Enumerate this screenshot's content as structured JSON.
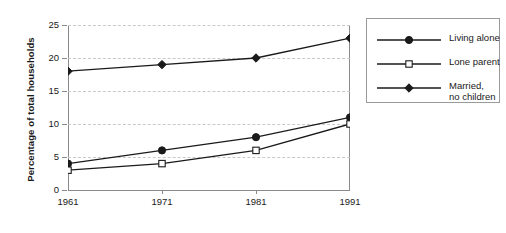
{
  "chart_data": {
    "type": "line",
    "title": "",
    "xlabel": "",
    "ylabel": "Percentage of total households",
    "categories": [
      "1961",
      "1971",
      "1981",
      "1991"
    ],
    "x": [
      1961,
      1971,
      1981,
      1991
    ],
    "xlim": [
      1961,
      1991
    ],
    "ylim": [
      0,
      25
    ],
    "yticks": [
      "0",
      "5",
      "10",
      "15",
      "20",
      "25"
    ],
    "ytick_values": [
      0,
      5,
      10,
      15,
      20,
      25
    ],
    "grid": "horizontal-dashed",
    "legend_position": "right-outside",
    "series": [
      {
        "name": "Living alone",
        "marker": "filled-circle",
        "values": [
          4,
          6,
          8,
          11
        ]
      },
      {
        "name": "Lone parent",
        "marker": "open-square",
        "values": [
          3,
          4,
          6,
          10
        ]
      },
      {
        "name": "Married,\nno children",
        "marker": "filled-diamond",
        "values": [
          18,
          19,
          20,
          23
        ]
      }
    ]
  },
  "axis": {
    "y_title": "Percentage of total households",
    "y_ticks": [
      "0",
      "5",
      "10",
      "15",
      "20",
      "25"
    ],
    "x_ticks": [
      "1961",
      "1971",
      "1981",
      "1991"
    ]
  },
  "legend": {
    "items": [
      {
        "label": "Living alone",
        "label_line2": "",
        "marker": "filled-circle"
      },
      {
        "label": "Lone parent",
        "label_line2": "",
        "marker": "open-square"
      },
      {
        "label": "Married,",
        "label_line2": "no children",
        "marker": "filled-diamond"
      }
    ]
  },
  "colors": {
    "line": "#1a1a1a",
    "axis": "#8a8a8a",
    "grid": "#c9c9c9",
    "background": "#ffffff",
    "legend_border": "#9a9a9a"
  }
}
